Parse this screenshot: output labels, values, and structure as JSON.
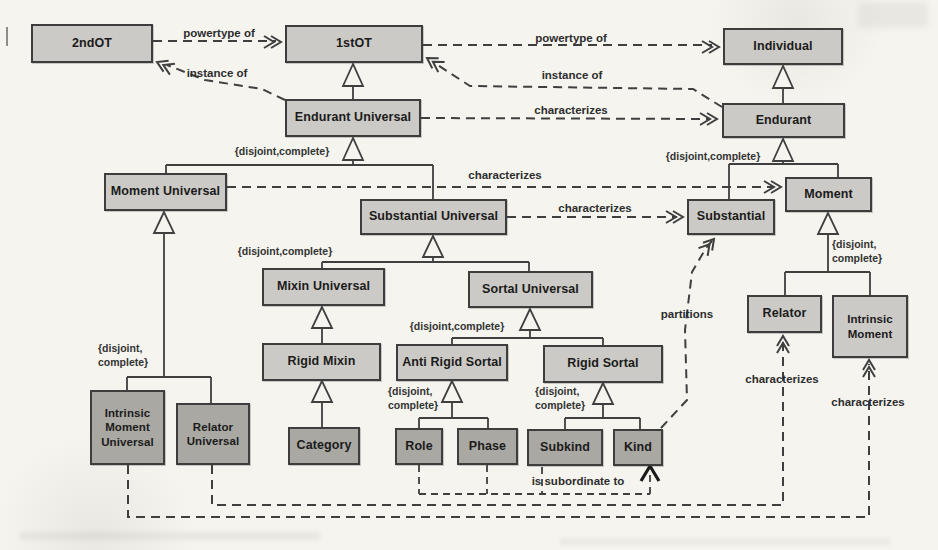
{
  "diagram": {
    "type": "uml-class-diagram",
    "nodes": {
      "second_ot": "2ndOT",
      "first_ot": "1stOT",
      "individual": "Individual",
      "endurant_universal": "Endurant Universal",
      "endurant": "Endurant",
      "moment_universal": "Moment Universal",
      "substantial_universal": "Substantial Universal",
      "substantial": "Substantial",
      "moment": "Moment",
      "mixin_universal": "Mixin Universal",
      "sortal_universal": "Sortal Universal",
      "rigid_mixin": "Rigid Mixin",
      "anti_rigid_sortal": "Anti Rigid Sortal",
      "rigid_sortal": "Rigid Sortal",
      "relator": "Relator",
      "intrinsic_moment": "Intrinsic\nMoment",
      "intrinsic_moment_universal": "Intrinsic\nMoment\nUniversal",
      "relator_universal": "Relator\nUniversal",
      "category": "Category",
      "role": "Role",
      "phase": "Phase",
      "subkind": "Subkind",
      "kind": "Kind"
    },
    "edge_labels": {
      "powertype_of_1": "powertype of",
      "powertype_of_2": "powertype of",
      "instance_of_1": "instance of",
      "instance_of_2": "instance of",
      "characterizes_eu": "characterizes",
      "characterizes_mu": "characterizes",
      "characterizes_su": "characterizes",
      "characterizes_ru": "characterizes",
      "characterizes_imu": "characterizes",
      "partitions": "partitions",
      "is_subordinate_to": "is subordinate to",
      "dc_endurant_universal": "{disjoint,complete}",
      "dc_endurant": "{disjoint,complete}",
      "dc_substantial_universal": "{disjoint,complete}",
      "dc_sortal_universal": "{disjoint,complete}",
      "dc_moment": "{disjoint,\ncomplete}",
      "dc_moment_universal": "{disjoint,\ncomplete}",
      "dc_anti_rigid_sortal": "{disjoint,\ncomplete}",
      "dc_rigid_sortal": "{disjoint,\ncomplete}"
    },
    "edges": {
      "generalizations": [
        {
          "from": "Endurant Universal",
          "to": "1stOT"
        },
        {
          "from": "Endurant",
          "to": "Individual"
        },
        {
          "from": "Moment Universal",
          "to": "Endurant Universal"
        },
        {
          "from": "Substantial Universal",
          "to": "Endurant Universal"
        },
        {
          "from": "Substantial",
          "to": "Endurant"
        },
        {
          "from": "Moment",
          "to": "Endurant"
        },
        {
          "from": "Relator",
          "to": "Moment"
        },
        {
          "from": "Intrinsic Moment",
          "to": "Moment"
        },
        {
          "from": "Intrinsic Moment Universal",
          "to": "Moment Universal"
        },
        {
          "from": "Relator Universal",
          "to": "Moment Universal"
        },
        {
          "from": "Mixin Universal",
          "to": "Substantial Universal"
        },
        {
          "from": "Sortal Universal",
          "to": "Substantial Universal"
        },
        {
          "from": "Rigid Mixin",
          "to": "Mixin Universal"
        },
        {
          "from": "Anti Rigid Sortal",
          "to": "Sortal Universal"
        },
        {
          "from": "Rigid Sortal",
          "to": "Sortal Universal"
        },
        {
          "from": "Category",
          "to": "Rigid Mixin"
        },
        {
          "from": "Role",
          "to": "Anti Rigid Sortal"
        },
        {
          "from": "Phase",
          "to": "Anti Rigid Sortal"
        },
        {
          "from": "Subkind",
          "to": "Rigid Sortal"
        },
        {
          "from": "Kind",
          "to": "Rigid Sortal"
        }
      ],
      "dependencies": [
        {
          "from": "2ndOT",
          "to": "1stOT",
          "label": "powertype of"
        },
        {
          "from": "1stOT",
          "to": "Individual",
          "label": "powertype of"
        },
        {
          "from": "Endurant Universal",
          "to": "2ndOT",
          "label": "instance of"
        },
        {
          "from": "Endurant",
          "to": "1stOT",
          "label": "instance of"
        },
        {
          "from": "Endurant Universal",
          "to": "Endurant",
          "label": "characterizes"
        },
        {
          "from": "Moment Universal",
          "to": "Moment",
          "label": "characterizes"
        },
        {
          "from": "Substantial Universal",
          "to": "Substantial",
          "label": "characterizes"
        },
        {
          "from": "Relator Universal",
          "to": "Relator",
          "label": "characterizes"
        },
        {
          "from": "Intrinsic Moment Universal",
          "to": "Intrinsic Moment",
          "label": "characterizes"
        },
        {
          "from": "Kind",
          "to": "Substantial",
          "label": "partitions"
        },
        {
          "from": "Role, Phase, Subkind",
          "to": "Kind",
          "label": "is subordinate to"
        }
      ],
      "generalization_sets": [
        {
          "parent": "Endurant Universal",
          "constraint": "{disjoint,complete}"
        },
        {
          "parent": "Endurant",
          "constraint": "{disjoint,complete}"
        },
        {
          "parent": "Moment Universal",
          "constraint": "{disjoint,complete}"
        },
        {
          "parent": "Substantial Universal",
          "constraint": "{disjoint,complete}"
        },
        {
          "parent": "Sortal Universal",
          "constraint": "{disjoint,complete}"
        },
        {
          "parent": "Moment",
          "constraint": "{disjoint,complete}"
        },
        {
          "parent": "Anti Rigid Sortal",
          "constraint": "{disjoint,complete}"
        },
        {
          "parent": "Rigid Sortal",
          "constraint": "{disjoint,complete}"
        }
      ]
    },
    "colors": {
      "node_light": "#cbcac6",
      "node_dark": "#a9a8a3",
      "border": "#3d3d3d",
      "line": "#3f3f3f",
      "background": "#f5f4ef",
      "text": "#1b1b1b"
    }
  }
}
